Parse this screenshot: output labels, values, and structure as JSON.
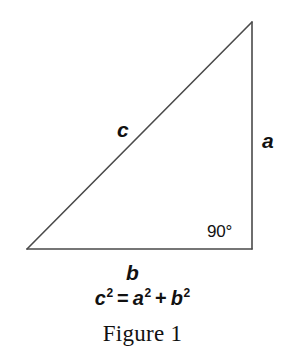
{
  "figure": {
    "caption": "Figure 1",
    "background_color": "#ffffff",
    "stroke_color": "#4a4a4a",
    "text_color": "#111111"
  },
  "diagram": {
    "type": "right-triangle",
    "vertices": {
      "left": [
        27,
        249
      ],
      "bottom_right": [
        252,
        249
      ],
      "top": [
        252,
        22
      ]
    },
    "sides": [
      {
        "id": "hypotenuse",
        "label": "c",
        "from": "left",
        "to": "top"
      },
      {
        "id": "vertical-leg",
        "label": "a",
        "from": "top",
        "to": "bottom_right"
      },
      {
        "id": "base-leg",
        "label": "b",
        "from": "left",
        "to": "bottom_right"
      }
    ],
    "angles": [
      {
        "id": "right-angle",
        "label": "90°",
        "at": "bottom_right"
      }
    ]
  },
  "labels": {
    "hypotenuse": "c",
    "vertical_leg": "a",
    "base_leg": "b",
    "right_angle": "90°"
  },
  "equation": {
    "full_text": "c² = a² + b²",
    "left_base": "c",
    "left_exponent": "2",
    "equals": "=",
    "first_base": "a",
    "first_exponent": "2",
    "plus": "+",
    "second_base": "b",
    "second_exponent": "2"
  }
}
